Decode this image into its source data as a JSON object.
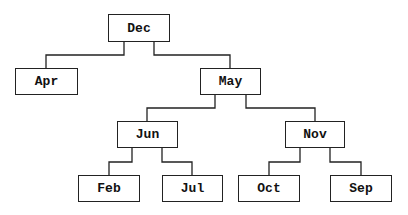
{
  "tree": {
    "nodes": [
      {
        "id": "dec",
        "label": "Dec",
        "x": 108,
        "y": 14,
        "w": 62,
        "h": 28
      },
      {
        "id": "apr",
        "label": "Apr",
        "x": 15,
        "y": 68,
        "w": 63,
        "h": 27
      },
      {
        "id": "may",
        "label": "May",
        "x": 200,
        "y": 68,
        "w": 61,
        "h": 27
      },
      {
        "id": "jun",
        "label": "Jun",
        "x": 117,
        "y": 121,
        "w": 61,
        "h": 27
      },
      {
        "id": "nov",
        "label": "Nov",
        "x": 285,
        "y": 121,
        "w": 60,
        "h": 27
      },
      {
        "id": "feb",
        "label": "Feb",
        "x": 78,
        "y": 175,
        "w": 62,
        "h": 27
      },
      {
        "id": "jul",
        "label": "Jul",
        "x": 162,
        "y": 175,
        "w": 61,
        "h": 27
      },
      {
        "id": "oct",
        "label": "Oct",
        "x": 238,
        "y": 175,
        "w": 62,
        "h": 27
      },
      {
        "id": "sep",
        "label": "Sep",
        "x": 330,
        "y": 175,
        "w": 62,
        "h": 27
      }
    ],
    "edges": [
      [
        "dec",
        "apr"
      ],
      [
        "dec",
        "may"
      ],
      [
        "may",
        "jun"
      ],
      [
        "may",
        "nov"
      ],
      [
        "jun",
        "feb"
      ],
      [
        "jun",
        "jul"
      ],
      [
        "nov",
        "oct"
      ],
      [
        "nov",
        "sep"
      ]
    ]
  }
}
